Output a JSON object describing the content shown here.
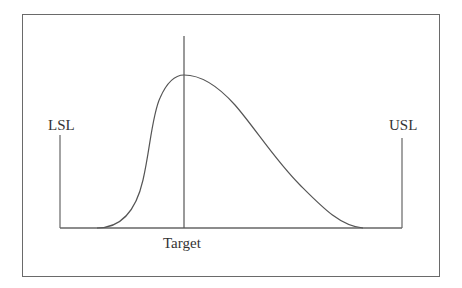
{
  "diagram": {
    "type": "process-capability-distribution",
    "labels": {
      "lsl": "LSL",
      "usl": "USL",
      "target": "Target"
    },
    "colors": {
      "line": "#555555",
      "frame": "#6a6a6a",
      "text": "#333333",
      "background": "#ffffff"
    }
  }
}
